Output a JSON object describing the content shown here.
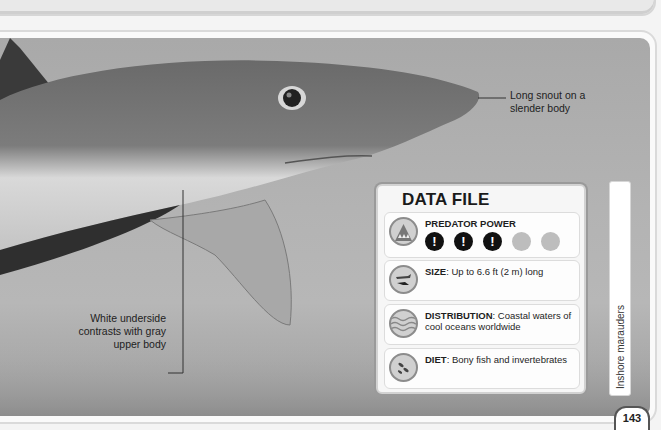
{
  "page": {
    "number": "143",
    "section_tab": "Inshore marauders"
  },
  "photo": {
    "subject": "shark-photo",
    "callouts": {
      "snout": "Long snout on a slender body",
      "underside": "White underside contrasts with gray upper body"
    }
  },
  "data_file": {
    "title": "DATA FILE",
    "predator_power": {
      "label": "PREDATOR POWER",
      "filled": 3,
      "total": 5,
      "dot_glyph": "!"
    },
    "size": {
      "label": "SIZE",
      "text": ": Up to 6.6 ft (2 m) long"
    },
    "distribution": {
      "label": "DISTRIBUTION",
      "text": ": Coastal waters of cool oceans worldwide"
    },
    "diet": {
      "label": "DIET",
      "text": ": Bony fish and invertebrates"
    },
    "icons": [
      "shark-jaws-icon",
      "size-comparison-icon",
      "waves-icon",
      "fish-icon"
    ]
  },
  "colors": {
    "text": "#1e1e1e",
    "dot_on": "#111111",
    "dot_off": "#bdbdbd",
    "panel_border": "#d2d2d2"
  }
}
